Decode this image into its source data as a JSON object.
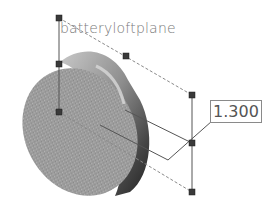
{
  "viewport": {
    "plane_name": "batteryloftplane",
    "dimension": {
      "value": "1.300"
    },
    "model": {
      "shape": "cylinder",
      "face_color": "#9a9a9a",
      "side_color": "#6e6e6e",
      "shadow_color": "#2e2e2e"
    },
    "handles": [
      {
        "x": 59,
        "y": 18
      },
      {
        "x": 59,
        "y": 64
      },
      {
        "x": 59,
        "y": 112
      },
      {
        "x": 126,
        "y": 56
      },
      {
        "x": 192,
        "y": 95
      },
      {
        "x": 192,
        "y": 143
      },
      {
        "x": 192,
        "y": 192
      }
    ],
    "colors": {
      "handle": "#3a3a3a",
      "line": "#555555",
      "dashed": "#8a8a8a"
    }
  }
}
